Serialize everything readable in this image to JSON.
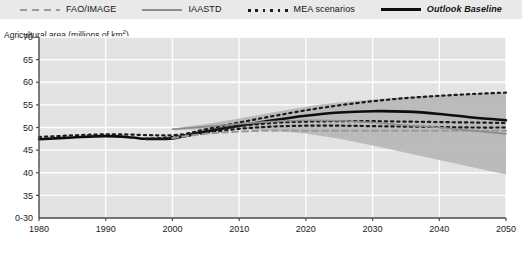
{
  "legend": {
    "items": [
      {
        "label": "FAO/IMAGE",
        "style": "dashed-gray",
        "swatch_name": "dashed-gray-swatch",
        "color": "#9a9a9a"
      },
      {
        "label": "IAASTD",
        "style": "solid-gray",
        "swatch_name": "solid-gray-swatch",
        "color": "#8d8d8d"
      },
      {
        "label": "MEA scenarios",
        "style": "dotted-black",
        "swatch_name": "dotted-black-swatch",
        "color": "#1b1b1b"
      },
      {
        "label": "Outlook Baseline",
        "style": "thick-black",
        "swatch_name": "thick-black-swatch",
        "color": "#0d0d0d",
        "italic": true
      }
    ]
  },
  "axis_title": "Agricultural area (millions of km",
  "axis_title_sup": "2",
  "axis_title_tail": ")",
  "chart_data": {
    "type": "line",
    "title": "",
    "subtitle": "",
    "xlabel": "",
    "ylabel": "Agricultural area (millions of km2)",
    "xlim": [
      1980,
      2050
    ],
    "ylim": [
      30,
      70
    ],
    "xticks": [
      1980,
      1990,
      2000,
      2010,
      2020,
      2030,
      2040,
      2050
    ],
    "yticks": [
      30,
      35,
      40,
      45,
      50,
      55,
      60,
      65,
      70
    ],
    "ytick_labels": [
      "0-30",
      "35",
      "40",
      "45",
      "50",
      "55",
      "60",
      "65",
      "70"
    ],
    "axis_break": true,
    "grid": true,
    "grid_color": "#ffffff",
    "plot_bg": "#e3e3e3",
    "legend_position": "top",
    "band": {
      "name": "IAASTD range",
      "fill": "#b8b8b8",
      "x": [
        2000,
        2005,
        2010,
        2015,
        2020,
        2025,
        2030,
        2035,
        2040,
        2045,
        2050
      ],
      "upper": [
        49.8,
        50.8,
        52.0,
        53.3,
        54.6,
        55.5,
        56.2,
        56.7,
        57.1,
        57.4,
        57.6
      ],
      "lower": [
        49.4,
        49.6,
        49.6,
        49.3,
        48.7,
        47.5,
        46.0,
        44.4,
        42.8,
        41.2,
        39.6
      ]
    },
    "series": [
      {
        "name": "Historical / Outlook Baseline",
        "legend": "Outlook Baseline",
        "style": "thick-black",
        "color": "#0d0d0d",
        "width": 2.6,
        "x": [
          1980,
          1985,
          1990,
          1994,
          1996,
          2000,
          2005,
          2010,
          2015,
          2020,
          2025,
          2030,
          2035,
          2040,
          2045,
          2050
        ],
        "values": [
          47.4,
          47.8,
          48.1,
          47.8,
          47.5,
          47.6,
          49.1,
          50.4,
          51.6,
          52.6,
          53.3,
          53.6,
          53.5,
          53.0,
          52.2,
          51.6
        ]
      },
      {
        "name": "MEA scenario upper",
        "legend": "MEA scenarios",
        "style": "dotted-black",
        "color": "#1b1b1b",
        "width": 2.2,
        "x": [
          1980,
          1990,
          2000,
          2005,
          2010,
          2015,
          2020,
          2025,
          2030,
          2035,
          2040,
          2045,
          2050
        ],
        "values": [
          47.9,
          48.5,
          48.3,
          49.6,
          51.1,
          52.5,
          53.8,
          54.9,
          55.8,
          56.5,
          57.0,
          57.4,
          57.7
        ]
      },
      {
        "name": "MEA scenario middle",
        "legend": "MEA scenarios",
        "style": "dotted-black",
        "color": "#1b1b1b",
        "width": 2.2,
        "x": [
          1996,
          2000,
          2005,
          2010,
          2015,
          2020,
          2025,
          2030,
          2035,
          2040,
          2045,
          2050
        ],
        "values": [
          47.5,
          47.9,
          49.2,
          50.3,
          51.0,
          51.3,
          51.4,
          51.4,
          51.3,
          51.2,
          51.1,
          51.0
        ]
      },
      {
        "name": "MEA scenario lower",
        "legend": "MEA scenarios",
        "style": "dotted-black",
        "color": "#1b1b1b",
        "width": 2.2,
        "x": [
          1996,
          2000,
          2005,
          2010,
          2015,
          2020,
          2025,
          2030,
          2035,
          2040,
          2045,
          2050
        ],
        "values": [
          47.4,
          47.7,
          48.8,
          49.7,
          50.2,
          50.4,
          50.4,
          50.3,
          50.2,
          50.1,
          50.0,
          50.0
        ]
      },
      {
        "name": "FAO/IMAGE",
        "legend": "FAO/IMAGE",
        "style": "dashed-gray",
        "color": "#9a9a9a",
        "width": 2.0,
        "x": [
          2000,
          2005,
          2010,
          2015,
          2020,
          2025,
          2030,
          2035,
          2040,
          2045,
          2050
        ],
        "values": [
          47.7,
          48.6,
          49.1,
          49.3,
          49.3,
          49.3,
          49.3,
          49.3,
          49.3,
          49.3,
          49.3
        ]
      },
      {
        "name": "IAASTD",
        "legend": "IAASTD",
        "style": "solid-gray",
        "color": "#8d8d8d",
        "width": 1.6,
        "x": [
          2000,
          2005,
          2010,
          2015,
          2020,
          2025,
          2030,
          2035,
          2040,
          2045,
          2050
        ],
        "values": [
          49.6,
          50.2,
          50.8,
          51.3,
          51.6,
          51.5,
          51.1,
          50.5,
          50.0,
          49.3,
          48.6
        ]
      }
    ]
  }
}
